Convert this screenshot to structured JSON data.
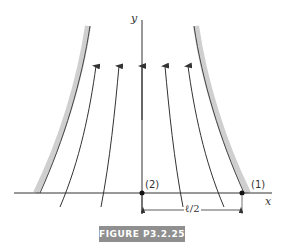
{
  "figure": {
    "caption": "FIGURE P3.2.25",
    "axes": {
      "x_label": "x",
      "y_label": "y"
    },
    "points": [
      {
        "id": "point-1",
        "label": "(1)"
      },
      {
        "id": "point-2",
        "label": "(2)"
      }
    ],
    "dimension": {
      "label": "ℓ/2"
    },
    "colors": {
      "line": "#333333",
      "wall": "#cfcfcf",
      "caption_bg": "#8f8f8f",
      "caption_text": "#ffffff"
    }
  }
}
